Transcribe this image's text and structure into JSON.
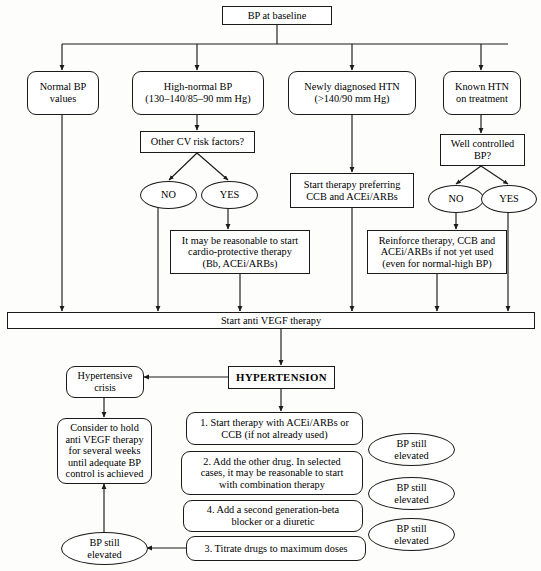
{
  "figure": {
    "type": "flowchart",
    "width": 541,
    "height": 571,
    "stroke_color": "#1a1a1a",
    "background_color": "#fdfdfc"
  },
  "nodes": {
    "bp_at_baseline": "BP at baseline",
    "normal_bp_values_l1": "Normal BP",
    "normal_bp_values_l2": "values",
    "high_normal_bp_l1": "High-normal BP",
    "high_normal_bp_l2": "(130–140/85–90 mm Hg)",
    "newly_diagnosed_htn_l1": "Newly diagnosed HTN",
    "newly_diagnosed_htn_l2": "(>140/90 mm Hg)",
    "known_htn_l1": "Known HTN",
    "known_htn_l2": "on treatment",
    "other_cv_risk_factors": "Other CV risk factors?",
    "well_controlled_bp_l1": "Well controlled",
    "well_controlled_bp_l2": "BP?",
    "cv_no": "NO",
    "cv_yes": "YES",
    "wc_no": "NO",
    "wc_yes": "YES",
    "start_therapy_preferring_l1": "Start therapy preferring",
    "start_therapy_preferring_l2": "CCB and ACEi/ARBs",
    "cardio_protective_l1": "It may be reasonable to start",
    "cardio_protective_l2": "cardio-protective therapy",
    "cardio_protective_l3": "(Bb, ACEi/ARBs)",
    "reinforce_therapy_l1": "Reinforce therapy, CCB and",
    "reinforce_therapy_l2": "ACEi/ARBs if not yet used",
    "reinforce_therapy_l3": "(even for normal-high BP)",
    "start_anti_vegf": "Start anti VEGF therapy",
    "hypertension": "HYPERTENSION",
    "hypertensive_crisis_l1": "Hypertensive",
    "hypertensive_crisis_l2": "crisis",
    "consider_hold_l1": "Consider to hold",
    "consider_hold_l2": "anti VEGF therapy",
    "consider_hold_l3": "for several weeks",
    "consider_hold_l4": "until adequate BP",
    "consider_hold_l5": "control is achieved",
    "step1_l1": "1. Start therapy with ACEi/ARBs or",
    "step1_l2": "CCB (if not already used)",
    "step2_l1": "2. Add the other drug. In selected",
    "step2_l2": "cases, it may be reasonable to start",
    "step2_l3": "with combination therapy",
    "step4_l1": "4. Add a second generation-beta",
    "step4_l2": "blocker or a diuretic",
    "step3": "3. Titrate drugs to maximum doses",
    "bp_still_elevated_1_l1": "BP still",
    "bp_still_elevated_1_l2": "elevated",
    "bp_still_elevated_2_l1": "BP still",
    "bp_still_elevated_2_l2": "elevated",
    "bp_still_elevated_3_l1": "BP still",
    "bp_still_elevated_3_l2": "elevated",
    "bp_still_elevated_left_l1": "BP still",
    "bp_still_elevated_left_l2": "elevated"
  },
  "edges": [
    {
      "from": "bp_at_baseline",
      "to": "normal_bp_values"
    },
    {
      "from": "bp_at_baseline",
      "to": "high_normal_bp"
    },
    {
      "from": "bp_at_baseline",
      "to": "newly_diagnosed_htn"
    },
    {
      "from": "bp_at_baseline",
      "to": "known_htn"
    },
    {
      "from": "high_normal_bp",
      "to": "other_cv_risk_factors"
    },
    {
      "from": "other_cv_risk_factors",
      "to": "cv_no"
    },
    {
      "from": "other_cv_risk_factors",
      "to": "cv_yes"
    },
    {
      "from": "cv_yes",
      "to": "cardio_protective"
    },
    {
      "from": "cv_no",
      "to": "start_anti_vegf"
    },
    {
      "from": "cardio_protective",
      "to": "start_anti_vegf"
    },
    {
      "from": "normal_bp_values",
      "to": "start_anti_vegf"
    },
    {
      "from": "newly_diagnosed_htn",
      "to": "start_therapy_preferring"
    },
    {
      "from": "start_therapy_preferring",
      "to": "start_anti_vegf"
    },
    {
      "from": "known_htn",
      "to": "well_controlled_bp"
    },
    {
      "from": "well_controlled_bp",
      "to": "wc_no"
    },
    {
      "from": "well_controlled_bp",
      "to": "wc_yes"
    },
    {
      "from": "wc_no",
      "to": "reinforce_therapy"
    },
    {
      "from": "reinforce_therapy",
      "to": "start_anti_vegf"
    },
    {
      "from": "wc_yes",
      "to": "start_anti_vegf"
    },
    {
      "from": "start_anti_vegf",
      "to": "hypertension"
    },
    {
      "from": "hypertension",
      "to": "hypertensive_crisis"
    },
    {
      "from": "hypertension",
      "to": "step1"
    },
    {
      "from": "hypertensive_crisis",
      "to": "consider_hold"
    },
    {
      "from": "step3",
      "to": "bp_still_elevated_left"
    },
    {
      "from": "bp_still_elevated_left",
      "to": "consider_hold"
    }
  ]
}
